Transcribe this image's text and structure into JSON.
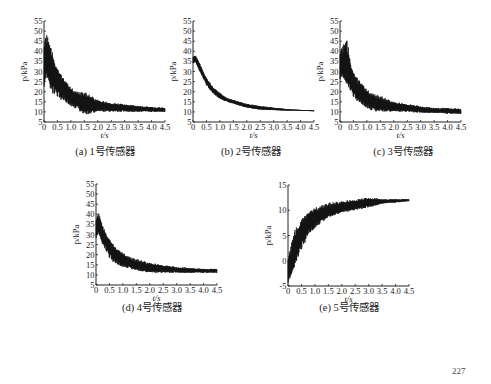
{
  "page_number": "227",
  "chart_data": [
    {
      "id": "a",
      "type": "line",
      "caption": "(a) 1号传感器",
      "xlabel": "t/s",
      "ylabel": "p/kPa",
      "xlim": [
        0,
        4.5
      ],
      "ylim": [
        5,
        55
      ],
      "xticks": [
        "0",
        "0.5",
        "1.0",
        "1.5",
        "2.0",
        "2.5",
        "3.0",
        "3.5",
        "4.0",
        "4.5"
      ],
      "yticks": [
        "5",
        "10",
        "15",
        "20",
        "25",
        "30",
        "35",
        "40",
        "45",
        "50",
        "55"
      ],
      "x": [
        0,
        0.1,
        0.2,
        0.3,
        0.5,
        0.75,
        1.0,
        1.25,
        1.5,
        2.0,
        2.5,
        3.0,
        3.5,
        4.0,
        4.5
      ],
      "values": [
        36,
        38,
        35,
        31,
        25,
        21,
        18,
        16,
        15,
        13,
        12.5,
        12,
        11.5,
        11,
        11
      ],
      "envelope_upper": [
        47,
        49,
        44,
        40,
        32,
        26,
        22,
        20,
        20,
        16,
        14.5,
        14,
        13,
        12.5,
        12
      ],
      "envelope_lower": [
        22,
        24,
        23,
        19,
        17,
        15,
        13,
        11,
        8,
        10,
        10,
        10,
        10,
        10,
        10
      ],
      "color": "#111111"
    },
    {
      "id": "b",
      "type": "line",
      "caption": "(b) 2号传感器",
      "xlabel": "t/s",
      "ylabel": "p/kPa",
      "xlim": [
        0,
        4.5
      ],
      "ylim": [
        5,
        55
      ],
      "xticks": [
        "0",
        "0.5",
        "1.0",
        "1.5",
        "2.0",
        "2.5",
        "3.0",
        "3.5",
        "4.0",
        "4.5"
      ],
      "yticks": [
        "5",
        "10",
        "15",
        "20",
        "25",
        "30",
        "35",
        "40",
        "45",
        "50",
        "55"
      ],
      "x": [
        0,
        0.1,
        0.25,
        0.5,
        0.75,
        1.0,
        1.25,
        1.5,
        2.0,
        2.5,
        3.0,
        3.5,
        4.0,
        4.5
      ],
      "values": [
        36,
        36,
        32,
        25,
        20.5,
        18,
        16,
        15,
        13,
        12,
        11.5,
        11,
        10.8,
        10.5
      ],
      "envelope_upper": [
        38,
        38,
        34,
        27,
        22,
        19.5,
        17,
        16,
        14,
        13,
        12.2,
        11.4,
        11,
        10.8
      ],
      "envelope_lower": [
        34,
        34,
        30,
        23,
        19,
        16.5,
        15,
        14,
        12,
        11,
        10.8,
        10.6,
        10.5,
        10.3
      ],
      "color": "#111111"
    },
    {
      "id": "c",
      "type": "line",
      "caption": "(c) 3号传感器",
      "xlabel": "t/s",
      "ylabel": "p/kPa",
      "xlim": [
        0,
        4.5
      ],
      "ylim": [
        5,
        55
      ],
      "xticks": [
        "0",
        "0.5",
        "1.0",
        "1.5",
        "2.0",
        "2.5",
        "3.0",
        "3.5",
        "4.0",
        "4.5"
      ],
      "yticks": [
        "5",
        "10",
        "15",
        "20",
        "25",
        "30",
        "35",
        "40",
        "45",
        "50",
        "55"
      ],
      "x": [
        0,
        0.1,
        0.25,
        0.5,
        0.75,
        1.0,
        1.25,
        1.5,
        2.0,
        2.5,
        3.0,
        3.5,
        4.0,
        4.5
      ],
      "values": [
        34,
        34,
        30,
        23,
        19,
        17,
        15,
        14,
        12.5,
        12,
        11,
        10.5,
        10.5,
        10
      ],
      "envelope_upper": [
        42,
        43,
        46,
        30,
        25,
        21,
        19,
        18,
        15,
        14,
        13,
        12,
        12,
        11.5
      ],
      "envelope_lower": [
        26,
        25,
        24,
        17,
        14,
        12,
        10,
        10,
        10,
        10,
        9.5,
        9.5,
        9,
        9
      ],
      "color": "#111111"
    },
    {
      "id": "d",
      "type": "line",
      "caption": "(d) 4号传感器",
      "xlabel": "t/s",
      "ylabel": "p/kPa",
      "xlim": [
        0,
        4.5
      ],
      "ylim": [
        5,
        55
      ],
      "xticks": [
        "0",
        "0.5",
        "1.0",
        "1.5",
        "2.0",
        "2.5",
        "3.0",
        "3.5",
        "4.0",
        "4.5"
      ],
      "yticks": [
        "5",
        "10",
        "15",
        "20",
        "25",
        "30",
        "35",
        "40",
        "45",
        "50",
        "55"
      ],
      "x": [
        0,
        0.1,
        0.25,
        0.5,
        0.75,
        1.0,
        1.25,
        1.5,
        2.0,
        2.5,
        3.0,
        3.5,
        4.0,
        4.5
      ],
      "values": [
        34,
        35,
        30,
        24,
        20,
        18,
        16,
        15,
        13.5,
        13,
        12.5,
        12,
        12,
        12
      ],
      "envelope_upper": [
        39,
        41,
        34,
        28,
        23,
        21,
        19,
        18,
        16,
        15,
        14,
        13.5,
        13,
        13
      ],
      "envelope_lower": [
        28,
        29,
        25,
        18,
        15,
        14,
        13,
        12,
        11,
        11,
        11,
        11,
        11,
        11
      ],
      "color": "#111111"
    },
    {
      "id": "e",
      "type": "line",
      "caption": "(e) 5号传感器",
      "xlabel": "t/s",
      "ylabel": "p/kPa",
      "xlim": [
        0,
        4.5
      ],
      "ylim": [
        -5,
        15
      ],
      "xticks": [
        "0",
        "0.5",
        "1.0",
        "1.5",
        "2.0",
        "2.5",
        "3.0",
        "3.5",
        "4.0",
        "4.5"
      ],
      "yticks": [
        "-5",
        "0",
        "5",
        "10",
        "15"
      ],
      "x": [
        0,
        0.1,
        0.25,
        0.5,
        0.75,
        1.0,
        1.25,
        1.5,
        2.0,
        2.5,
        3.0,
        3.5,
        4.0,
        4.5
      ],
      "values": [
        -1,
        -1,
        2,
        5.5,
        7.5,
        8.5,
        9.2,
        9.8,
        10.5,
        11,
        11.5,
        11.7,
        11.8,
        12
      ],
      "envelope_upper": [
        1,
        3,
        6,
        8.5,
        9.5,
        10.5,
        11,
        11.5,
        11.8,
        12.2,
        12.6,
        12.2,
        12.2,
        12.2
      ],
      "envelope_lower": [
        -4.5,
        -4,
        -1,
        2,
        5,
        6.5,
        7.5,
        8.5,
        9.5,
        10,
        10.5,
        11.3,
        11.5,
        11.8
      ],
      "color": "#111111"
    }
  ]
}
